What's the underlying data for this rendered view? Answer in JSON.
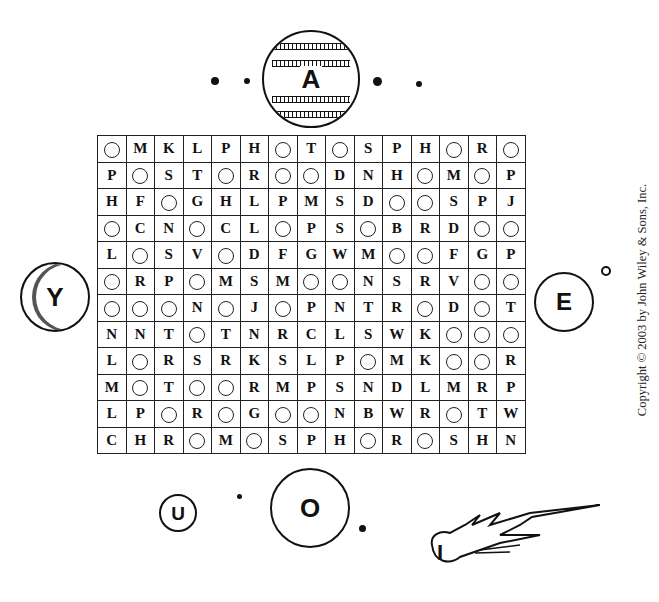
{
  "puzzle": {
    "type": "word-search",
    "blank_symbol": "○",
    "grid": [
      [
        "○",
        "M",
        "K",
        "L",
        "P",
        "H",
        "○",
        "T",
        "○",
        "S",
        "P",
        "H",
        "○",
        "R",
        "○"
      ],
      [
        "P",
        "○",
        "S",
        "T",
        "○",
        "R",
        "○",
        "○",
        "D",
        "N",
        "H",
        "○",
        "M",
        "○",
        "P"
      ],
      [
        "H",
        "F",
        "○",
        "G",
        "H",
        "L",
        "P",
        "M",
        "S",
        "D",
        "○",
        "○",
        "S",
        "P",
        "J"
      ],
      [
        "○",
        "C",
        "N",
        "○",
        "C",
        "L",
        "○",
        "P",
        "S",
        "○",
        "B",
        "R",
        "D",
        "○",
        "○"
      ],
      [
        "L",
        "○",
        "S",
        "V",
        "○",
        "D",
        "F",
        "G",
        "W",
        "M",
        "○",
        "○",
        "F",
        "G",
        "P"
      ],
      [
        "○",
        "R",
        "P",
        "○",
        "M",
        "S",
        "M",
        "○",
        "○",
        "N",
        "S",
        "R",
        "V",
        "○",
        "○"
      ],
      [
        "○",
        "○",
        "○",
        "N",
        "○",
        "J",
        "○",
        "P",
        "N",
        "T",
        "R",
        "○",
        "D",
        "○",
        "T"
      ],
      [
        "N",
        "N",
        "T",
        "○",
        "T",
        "N",
        "R",
        "C",
        "L",
        "S",
        "W",
        "K",
        "○",
        "○",
        "○"
      ],
      [
        "L",
        "○",
        "R",
        "S",
        "R",
        "K",
        "S",
        "L",
        "P",
        "○",
        "M",
        "K",
        "○",
        "○",
        "R"
      ],
      [
        "M",
        "○",
        "T",
        "○",
        "○",
        "R",
        "M",
        "P",
        "S",
        "N",
        "D",
        "L",
        "M",
        "R",
        "P"
      ],
      [
        "L",
        "P",
        "○",
        "R",
        "○",
        "G",
        "○",
        "○",
        "N",
        "B",
        "W",
        "R",
        "○",
        "T",
        "W"
      ],
      [
        "C",
        "H",
        "R",
        "○",
        "M",
        "○",
        "S",
        "P",
        "H",
        "○",
        "R",
        "○",
        "S",
        "H",
        "N"
      ]
    ]
  },
  "planets": {
    "top": {
      "letter": "A"
    },
    "left": {
      "letter": "Y"
    },
    "right": {
      "letter": "E"
    },
    "bottom_small": {
      "letter": "U"
    },
    "bottom_large": {
      "letter": "O"
    },
    "comet": {
      "letter": "I"
    }
  },
  "copyright": "Copyright © 2003 by John Wiley & Sons, Inc."
}
